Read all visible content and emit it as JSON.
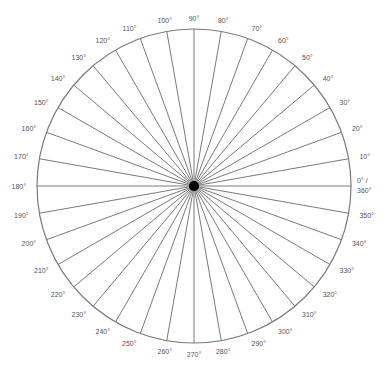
{
  "diagram": {
    "type": "polar-angle-chart",
    "center": {
      "x": 194,
      "y": 186
    },
    "radius": 157,
    "label_radius": 168,
    "step_degrees": 10,
    "colors": {
      "line": "#7a7a7a",
      "circle": "#7a7a7a",
      "center_dot": "#000000",
      "text": "#555555",
      "background": "#ffffff"
    },
    "labels": [
      {
        "angle": 0,
        "text": "0° /",
        "text2": "360°"
      },
      {
        "angle": 10,
        "text": "10°"
      },
      {
        "angle": 20,
        "text": "20°"
      },
      {
        "angle": 30,
        "text": "30°"
      },
      {
        "angle": 40,
        "text": "40°"
      },
      {
        "angle": 50,
        "text": "50°"
      },
      {
        "angle": 60,
        "text": "60°"
      },
      {
        "angle": 70,
        "text": "70°"
      },
      {
        "angle": 80,
        "text": "80°"
      },
      {
        "angle": 90,
        "text": "90°"
      },
      {
        "angle": 100,
        "text": "100°"
      },
      {
        "angle": 110,
        "text": "110°"
      },
      {
        "angle": 120,
        "text": "120°"
      },
      {
        "angle": 130,
        "text": "130°"
      },
      {
        "angle": 140,
        "text": "140°"
      },
      {
        "angle": 150,
        "text": "150°"
      },
      {
        "angle": 160,
        "text": "160°"
      },
      {
        "angle": 170,
        "text": "170°"
      },
      {
        "angle": 180,
        "text": "180°"
      },
      {
        "angle": 190,
        "text": "190°"
      },
      {
        "angle": 200,
        "text": "200°"
      },
      {
        "angle": 210,
        "text": "210°"
      },
      {
        "angle": 220,
        "text": "220°"
      },
      {
        "angle": 230,
        "text": "230°"
      },
      {
        "angle": 240,
        "text": "240°"
      },
      {
        "angle": 250,
        "text": "250°"
      },
      {
        "angle": 260,
        "text": "260°"
      },
      {
        "angle": 270,
        "text": "270°"
      },
      {
        "angle": 280,
        "text": "280°"
      },
      {
        "angle": 290,
        "text": "290°"
      },
      {
        "angle": 300,
        "text": "300°"
      },
      {
        "angle": 310,
        "text": "310°"
      },
      {
        "angle": 320,
        "text": "320°"
      },
      {
        "angle": 330,
        "text": "330°"
      },
      {
        "angle": 340,
        "text": "340°"
      },
      {
        "angle": 350,
        "text": "350°"
      }
    ]
  }
}
